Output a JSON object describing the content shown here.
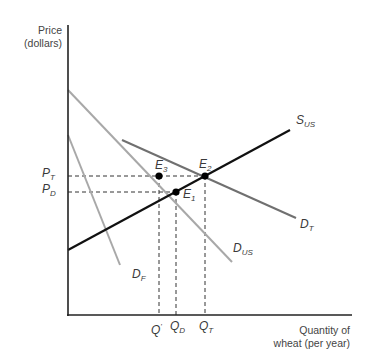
{
  "axes": {
    "y_title_line1": "Price",
    "y_title_line2": "(dollars)",
    "x_title_line1": "Quantity of",
    "x_title_line2": "wheat (per year)"
  },
  "curves": {
    "supply": {
      "base": "S",
      "sub": "US",
      "color": "#111111"
    },
    "demand_us": {
      "base": "D",
      "sub": "US",
      "color": "#a8a8a8"
    },
    "demand_foreign": {
      "base": "D",
      "sub": "F",
      "color": "#a8a8a8"
    },
    "demand_total": {
      "base": "D",
      "sub": "T",
      "color": "#707070"
    }
  },
  "points": {
    "e1": {
      "base": "E",
      "sub": "1"
    },
    "e2": {
      "base": "E",
      "sub": "2"
    },
    "e3": {
      "base": "E",
      "sub": "3"
    }
  },
  "price_ticks": {
    "pt": {
      "base": "P",
      "sub": "T"
    },
    "pd": {
      "base": "P",
      "sub": "D"
    }
  },
  "quantity_ticks": {
    "qprime": {
      "base": "Q",
      "sup": "'"
    },
    "qd": {
      "base": "Q",
      "sub": "D"
    },
    "qt": {
      "base": "Q",
      "sub": "T"
    }
  }
}
